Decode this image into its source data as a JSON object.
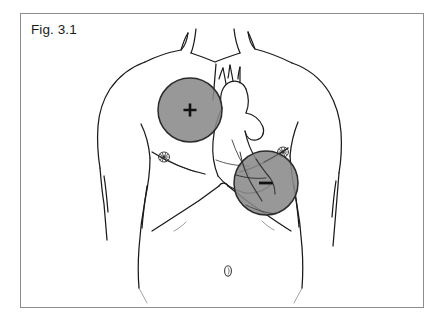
{
  "figure": {
    "caption": "Fig. 3.1"
  },
  "colors": {
    "frame_border": "#8c8c8c",
    "page_background": "#ffffff",
    "outline_ink": "#1a1a1a",
    "electrode_fill": "#8a8a8a",
    "electrode_stroke": "#2b2b2b",
    "label_text": "#111111"
  },
  "electrodes": [
    {
      "id": "positive-pad",
      "name": "positive-electrode-pad",
      "label": "+",
      "polarity": "positive",
      "placement": "right upper anterior chest",
      "cx": 190,
      "cy": 110,
      "r": 32
    },
    {
      "id": "negative-pad",
      "name": "negative-electrode-pad",
      "label": "–",
      "polarity": "negative",
      "placement": "left lower lateral chest",
      "cx": 266,
      "cy": 183,
      "r": 32
    }
  ],
  "anatomy_markers": [
    {
      "id": "nipple-right",
      "label": "",
      "cx": 164,
      "cy": 157
    },
    {
      "id": "nipple-left",
      "label": "",
      "cx": 283,
      "cy": 152
    },
    {
      "id": "navel",
      "label": "0",
      "cx": 228,
      "cy": 271
    }
  ],
  "icons": {
    "positive_sign": "plus-icon",
    "negative_sign": "minus-icon",
    "navel": "navel-icon",
    "nipple": "nipple-hatch-icon"
  }
}
